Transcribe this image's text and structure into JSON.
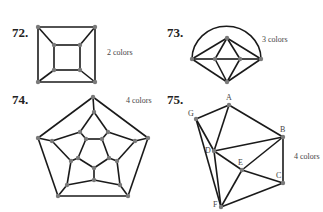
{
  "problems": [
    {
      "number": "72.",
      "label": "2 colors",
      "graph": {
        "vertices": [
          [
            38,
            27
          ],
          [
            95,
            27
          ],
          [
            95,
            82
          ],
          [
            38,
            82
          ],
          [
            54,
            45
          ],
          [
            80,
            45
          ],
          [
            80,
            70
          ],
          [
            54,
            70
          ]
        ],
        "edges": [
          [
            0,
            1
          ],
          [
            1,
            2
          ],
          [
            2,
            3
          ],
          [
            3,
            0
          ],
          [
            4,
            5
          ],
          [
            5,
            6
          ],
          [
            6,
            7
          ],
          [
            7,
            4
          ],
          [
            0,
            4
          ],
          [
            1,
            5
          ],
          [
            2,
            6
          ],
          [
            3,
            7
          ]
        ]
      }
    },
    {
      "number": "73.",
      "label": "3 colors",
      "graph": {
        "vertices": [
          [
            192,
            59
          ],
          [
            227,
            38
          ],
          [
            261,
            59
          ],
          [
            227,
            82
          ],
          [
            215,
            59
          ],
          [
            240,
            59
          ]
        ],
        "edges": [
          [
            0,
            1
          ],
          [
            1,
            2
          ],
          [
            2,
            3
          ],
          [
            3,
            0
          ],
          [
            0,
            4
          ],
          [
            4,
            5
          ],
          [
            5,
            2
          ],
          [
            1,
            4
          ],
          [
            1,
            5
          ],
          [
            3,
            4
          ],
          [
            3,
            5
          ]
        ],
        "arc": [
          0,
          2
        ]
      }
    },
    {
      "number": "74.",
      "label": "4 colors",
      "graph": {
        "vertices": [
          [
            93,
            97
          ],
          [
            148,
            138
          ],
          [
            128,
            196
          ],
          [
            58,
            196
          ],
          [
            38,
            138
          ],
          [
            94,
            112
          ],
          [
            108,
            132
          ],
          [
            135,
            141
          ],
          [
            117,
            161
          ],
          [
            120,
            185
          ],
          [
            94,
            180
          ],
          [
            67,
            185
          ],
          [
            71,
            161
          ],
          [
            52,
            141
          ],
          [
            80,
            132
          ],
          [
            86,
            139
          ],
          [
            102,
            139
          ],
          [
            109,
            158
          ],
          [
            94,
            168
          ],
          [
            78,
            158
          ]
        ],
        "edges": [
          [
            0,
            1
          ],
          [
            1,
            2
          ],
          [
            2,
            3
          ],
          [
            3,
            4
          ],
          [
            4,
            0
          ],
          [
            0,
            5
          ],
          [
            1,
            7
          ],
          [
            2,
            9
          ],
          [
            3,
            11
          ],
          [
            4,
            13
          ],
          [
            5,
            6
          ],
          [
            6,
            7
          ],
          [
            7,
            8
          ],
          [
            8,
            9
          ],
          [
            9,
            10
          ],
          [
            10,
            11
          ],
          [
            11,
            12
          ],
          [
            12,
            13
          ],
          [
            13,
            14
          ],
          [
            14,
            5
          ],
          [
            14,
            15
          ],
          [
            6,
            16
          ],
          [
            8,
            17
          ],
          [
            10,
            18
          ],
          [
            12,
            19
          ],
          [
            15,
            16
          ],
          [
            16,
            17
          ],
          [
            17,
            18
          ],
          [
            18,
            19
          ],
          [
            19,
            15
          ]
        ]
      }
    },
    {
      "number": "75.",
      "label": "4 colors",
      "graph": {
        "vertices": [
          {
            "name": "A",
            "pos": [
              229,
              105
            ]
          },
          {
            "name": "B",
            "pos": [
              283,
              137
            ]
          },
          {
            "name": "C",
            "pos": [
              283,
              183
            ]
          },
          {
            "name": "D",
            "pos": [
              214,
              151
            ]
          },
          {
            "name": "E",
            "pos": [
              242,
              170
            ]
          },
          {
            "name": "F",
            "pos": [
              221,
              207
            ]
          },
          {
            "name": "G",
            "pos": [
              196,
              119
            ]
          }
        ],
        "edges": [
          [
            "G",
            "A"
          ],
          [
            "A",
            "B"
          ],
          [
            "A",
            "D"
          ],
          [
            "G",
            "D"
          ],
          [
            "G",
            "F"
          ],
          [
            "D",
            "B"
          ],
          [
            "D",
            "F"
          ],
          [
            "D",
            "E"
          ],
          [
            "E",
            "B"
          ],
          [
            "E",
            "C"
          ],
          [
            "E",
            "F"
          ],
          [
            "B",
            "C"
          ],
          [
            "C",
            "F"
          ]
        ]
      }
    }
  ]
}
